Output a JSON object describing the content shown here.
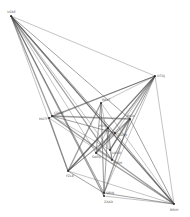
{
  "diagram": {
    "type": "network-graph",
    "background": "#ffffff",
    "edge_color": "#4a4a4a",
    "node_color": "#222222",
    "nodes": [
      {
        "id": "n1",
        "label": "VGKE",
        "x": 11,
        "y": 16,
        "lx": 7,
        "ly": 13
      },
      {
        "id": "n2",
        "label": "OTDJ",
        "x": 155,
        "y": 76,
        "lx": 157,
        "ly": 77
      },
      {
        "id": "n3",
        "label": "BRHY",
        "x": 174,
        "y": 204,
        "lx": 170,
        "ly": 211
      },
      {
        "id": "n4",
        "label": "CDGA",
        "x": 52,
        "y": 116,
        "lx": 54,
        "ly": 114
      },
      {
        "id": "n5",
        "label": "MUTF",
        "x": 49,
        "y": 118,
        "lx": 39,
        "ly": 120
      },
      {
        "id": "n6",
        "label": "FZLB",
        "x": 68,
        "y": 171,
        "lx": 66,
        "ly": 177
      },
      {
        "id": "n7",
        "label": "QBIN",
        "x": 104,
        "y": 193,
        "lx": 106,
        "ly": 194
      },
      {
        "id": "n8",
        "label": "ZXAD",
        "x": 104,
        "y": 196,
        "lx": 104,
        "ly": 203
      },
      {
        "id": "n9",
        "label": "HEPC",
        "x": 108,
        "y": 128,
        "lx": 99,
        "ly": 127
      },
      {
        "id": "n10",
        "label": "LWSO",
        "x": 110,
        "y": 150,
        "lx": 112,
        "ly": 154
      },
      {
        "id": "n11",
        "label": "RKVT",
        "x": 101,
        "y": 103,
        "lx": 102,
        "ly": 101
      },
      {
        "id": "n12",
        "label": "JNUX",
        "x": 130,
        "y": 119,
        "lx": 127,
        "ly": 117
      },
      {
        "id": "n13",
        "label": "PYGM",
        "x": 112,
        "y": 160,
        "lx": 113,
        "ly": 164
      },
      {
        "id": "n14",
        "label": "SAEQ",
        "x": 96,
        "y": 153,
        "lx": 92,
        "ly": 158
      },
      {
        "id": "n15",
        "label": "TODW",
        "x": 115,
        "y": 133,
        "lx": 117,
        "ly": 136
      }
    ],
    "edges": [
      [
        "n1",
        "n2"
      ],
      [
        "n1",
        "n3"
      ],
      [
        "n1",
        "n4"
      ],
      [
        "n1",
        "n6"
      ],
      [
        "n1",
        "n7"
      ],
      [
        "n1",
        "n9"
      ],
      [
        "n1",
        "n10"
      ],
      [
        "n1",
        "n12"
      ],
      [
        "n1",
        "n13"
      ],
      [
        "n1",
        "n14"
      ],
      [
        "n1",
        "n15"
      ],
      [
        "n1",
        "n8"
      ],
      [
        "n2",
        "n3"
      ],
      [
        "n2",
        "n4"
      ],
      [
        "n2",
        "n6"
      ],
      [
        "n2",
        "n7"
      ],
      [
        "n2",
        "n9"
      ],
      [
        "n2",
        "n10"
      ],
      [
        "n2",
        "n11"
      ],
      [
        "n2",
        "n13"
      ],
      [
        "n2",
        "n14"
      ],
      [
        "n2",
        "n15"
      ],
      [
        "n2",
        "n5"
      ],
      [
        "n3",
        "n4"
      ],
      [
        "n3",
        "n6"
      ],
      [
        "n3",
        "n7"
      ],
      [
        "n3",
        "n9"
      ],
      [
        "n3",
        "n11"
      ],
      [
        "n3",
        "n12"
      ],
      [
        "n3",
        "n14"
      ],
      [
        "n3",
        "n8"
      ],
      [
        "n3",
        "n15"
      ],
      [
        "n4",
        "n12"
      ],
      [
        "n4",
        "n10"
      ],
      [
        "n4",
        "n15"
      ],
      [
        "n5",
        "n6"
      ],
      [
        "n5",
        "n13"
      ],
      [
        "n6",
        "n7"
      ],
      [
        "n6",
        "n11"
      ],
      [
        "n6",
        "n12"
      ],
      [
        "n6",
        "n15"
      ],
      [
        "n6",
        "n9"
      ],
      [
        "n7",
        "n11"
      ],
      [
        "n7",
        "n9"
      ],
      [
        "n7",
        "n12"
      ],
      [
        "n8",
        "n11"
      ],
      [
        "n9",
        "n13"
      ],
      [
        "n10",
        "n12"
      ],
      [
        "n11",
        "n13"
      ],
      [
        "n11",
        "n14"
      ],
      [
        "n12",
        "n14"
      ],
      [
        "n9",
        "n14"
      ]
    ]
  }
}
